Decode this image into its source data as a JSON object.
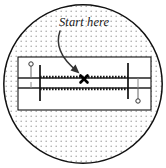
{
  "figure": {
    "type": "detail-callout-diagram",
    "background_color": "#ffffff",
    "annotation_label": "Start here",
    "stipple": {
      "dot_color": "#a8a8a8",
      "dot_spacing": 5,
      "dot_radius": 0.8
    },
    "detail_circle": {
      "name": "detail-view-circle",
      "center_x": 83,
      "center_y": 84,
      "radius": 80,
      "stroke_color": "#111111",
      "stroke_width": 1.4,
      "fill_color": "#ffffff"
    },
    "workpiece": {
      "name": "workpiece-rectangle",
      "x": 18,
      "y": 57,
      "width": 133,
      "height": 53,
      "stroke_color": "#111111",
      "stroke_width": 1.1,
      "fill_color": "#ffffff"
    },
    "reference_lines": [
      {
        "name": "upper-reference-line",
        "x1": 18,
        "y1": 78,
        "x2": 151,
        "y2": 78,
        "stroke_color": "#222222",
        "stroke_width": 1.5
      },
      {
        "name": "lower-reference-line",
        "x1": 18,
        "y1": 88,
        "x2": 151,
        "y2": 88,
        "stroke_color": "#222222",
        "stroke_width": 1.5
      }
    ],
    "dashed_lines": [
      {
        "name": "upper-dashed-cut-line",
        "x1": 40,
        "y1": 77,
        "x2": 128,
        "y2": 77,
        "stroke_color": "#1a1a1a",
        "stroke_width": 2.2,
        "dash": "1.6 1.4"
      },
      {
        "name": "lower-dashed-cut-line",
        "x1": 40,
        "y1": 89,
        "x2": 128,
        "y2": 89,
        "stroke_color": "#1a1a1a",
        "stroke_width": 2.2,
        "dash": "1.6 1.4"
      }
    ],
    "stop_bars": [
      {
        "name": "left-stop-bar",
        "x": 40,
        "y1": 65,
        "y2": 101,
        "stroke_color": "#111111",
        "stroke_width": 1.6
      },
      {
        "name": "right-stop-bar",
        "x": 128,
        "y1": 63,
        "y2": 99,
        "stroke_color": "#111111",
        "stroke_width": 1.6
      }
    ],
    "pin_markers": [
      {
        "name": "left-pin-marker",
        "circle_cx": 31,
        "circle_cy": 64,
        "circle_r": 2.2,
        "stem_x": 31,
        "stem_y1": 66,
        "stem_y2": 78,
        "stroke_color": "#555555",
        "stroke_width": 1
      },
      {
        "name": "right-pin-marker",
        "circle_cx": 138,
        "circle_cy": 101,
        "circle_r": 2.2,
        "stem_x": 138,
        "stem_y1": 88,
        "stem_y2": 99,
        "stroke_color": "#555555",
        "stroke_width": 1
      }
    ],
    "start_mark": {
      "name": "start-x-mark",
      "cx": 84,
      "cy": 79,
      "size": 5,
      "stroke_color": "#000000",
      "stroke_width": 2.6
    },
    "leader_arrow": {
      "name": "leader-arrow",
      "path": "M 60 31 C 56 44, 62 58, 78 72",
      "stroke_color": "#333333",
      "stroke_width": 1.5,
      "head_points": "78,73 71,69 75,65"
    },
    "label_position": {
      "x": 59,
      "y": 26
    }
  }
}
